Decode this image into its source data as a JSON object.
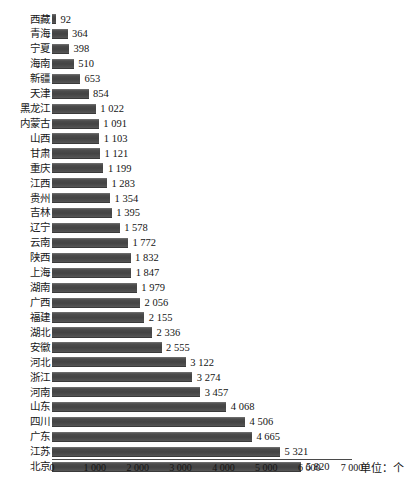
{
  "chart_data": {
    "type": "bar",
    "orientation": "horizontal",
    "title": "",
    "xlabel": "",
    "ylabel": "",
    "unit_label": "单位：个",
    "xlim": [
      0,
      7000
    ],
    "grid": false,
    "legend": null,
    "xticks": [
      "0",
      "1 000",
      "2 000",
      "3 000",
      "4 000",
      "5 000",
      "6 000",
      "7 000"
    ],
    "xtick_values": [
      0,
      1000,
      2000,
      3000,
      4000,
      5000,
      6000,
      7000
    ],
    "bar_color": "#4c4c4c",
    "background_color": "#ffffff",
    "categories": [
      "西藏",
      "青海",
      "宁夏",
      "海南",
      "新疆",
      "天津",
      "黑龙江",
      "内蒙古",
      "山西",
      "甘肃",
      "重庆",
      "江西",
      "贵州",
      "吉林",
      "辽宁",
      "云南",
      "陕西",
      "上海",
      "湖南",
      "广西",
      "福建",
      "湖北",
      "安徽",
      "河北",
      "浙江",
      "河南",
      "山东",
      "四川",
      "广东",
      "江苏",
      "北京"
    ],
    "values": [
      92,
      364,
      398,
      510,
      653,
      854,
      1022,
      1091,
      1103,
      1121,
      1199,
      1283,
      1354,
      1395,
      1578,
      1772,
      1832,
      1847,
      1979,
      2056,
      2155,
      2336,
      2555,
      3122,
      3274,
      3457,
      4068,
      4506,
      4665,
      5321,
      5820
    ],
    "value_labels": [
      "92",
      "364",
      "398",
      "510",
      "653",
      "854",
      "1 022",
      "1 091",
      "1 103",
      "1 121",
      "1 199",
      "1 283",
      "1 354",
      "1 395",
      "1 578",
      "1 772",
      "1 832",
      "1 847",
      "1 979",
      "2 056",
      "2 155",
      "2 336",
      "2 555",
      "3 122",
      "3 274",
      "3 457",
      "4 068",
      "4 506",
      "4 665",
      "5 321",
      "5 820"
    ]
  }
}
